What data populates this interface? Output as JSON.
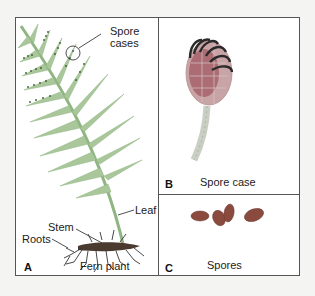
{
  "figure": {
    "panels": [
      {
        "letter": "A",
        "caption": "Fern plant",
        "labels": {
          "spore_cases": "Spore cases",
          "spore_line1": "Spore",
          "spore_line2": "cases",
          "leaf": "Leaf",
          "stem": "Stem",
          "roots": "Roots"
        }
      },
      {
        "letter": "B",
        "caption": "Spore case"
      },
      {
        "letter": "C",
        "caption": "Spores"
      }
    ],
    "colors": {
      "fern_green": "#a9c79a",
      "fern_dark": "#6f9a63",
      "spore_dots": "#3d5a35",
      "spore_case_cells": "#b2646a",
      "annulus": "#2a2a2a",
      "spores": "#8a4a3e",
      "border": "#555555"
    }
  }
}
